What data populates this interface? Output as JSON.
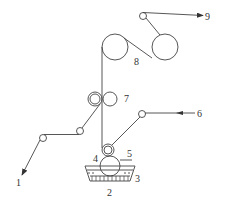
{
  "diagram": {
    "type": "roller coating process schematic",
    "labels": {
      "l1": "1",
      "l2": "2",
      "l3": "3",
      "l4": "4",
      "l5": "5",
      "l6": "6",
      "l7": "7",
      "l8": "8",
      "l9": "9"
    },
    "colors": {
      "stroke": "#444444",
      "background": "#ffffff"
    }
  }
}
